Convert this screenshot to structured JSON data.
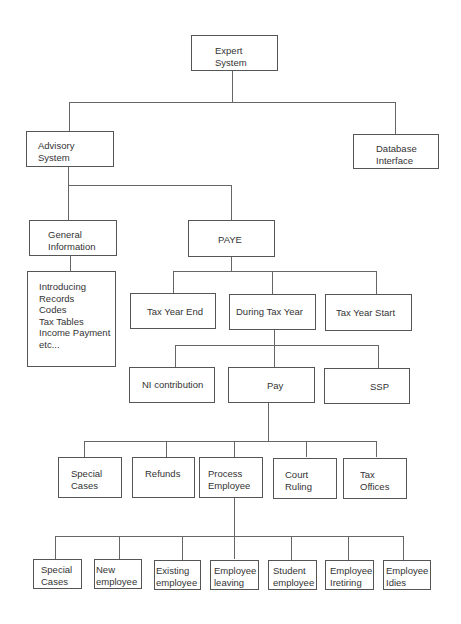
{
  "nodes": {
    "expert_system": [
      "Expert",
      "System"
    ],
    "advisory_system": [
      "Advisory",
      "System"
    ],
    "database_interface": [
      "Database",
      "Interface"
    ],
    "general_information": [
      "General",
      "Information"
    ],
    "paye": [
      "PAYE"
    ],
    "info_list": [
      "Introducing",
      "Records",
      "Codes",
      "Tax Tables",
      "Income Payment",
      "etc..."
    ],
    "tax_year_end": [
      "Tax Year End"
    ],
    "during_tax_year": [
      "During Tax Year"
    ],
    "tax_year_start": [
      "Tax Year Start"
    ],
    "ni_contribution": [
      "NI contribution"
    ],
    "pay": [
      "Pay"
    ],
    "ssp": [
      "SSP"
    ],
    "special_cases_1": [
      "Special",
      "Cases"
    ],
    "refunds": [
      "Refunds"
    ],
    "process_employee": [
      "Process",
      "Employee"
    ],
    "court_ruling": [
      "Court",
      "Ruling"
    ],
    "tax_offices": [
      "Tax",
      "Offices"
    ],
    "special_cases_2": [
      "Special",
      "Cases"
    ],
    "new_employee": [
      "New",
      "employee"
    ],
    "existing_employee": [
      "Existing",
      "employee"
    ],
    "employee_leaving": [
      "Employee",
      "leaving"
    ],
    "student_employee": [
      "Student",
      "employee"
    ],
    "employee_retiring": [
      "Employee",
      "Iretiring"
    ],
    "employee_dies": [
      "Employee",
      "Idies"
    ]
  }
}
